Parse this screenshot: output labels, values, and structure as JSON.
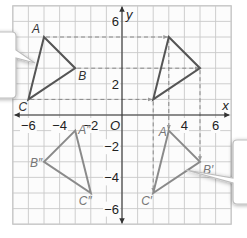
{
  "diagram": {
    "type": "coordinate-plane-transformation",
    "axes": {
      "x_label": "x",
      "y_label": "y",
      "origin_label": "O",
      "x_ticks": [
        {
          "value": -6,
          "label": "−6"
        },
        {
          "value": -4,
          "label": "−4"
        },
        {
          "value": -2,
          "label": "−2"
        },
        {
          "value": 4,
          "label": "4"
        },
        {
          "value": 6,
          "label": "6"
        }
      ],
      "y_ticks": [
        {
          "value": 6,
          "label": "6"
        },
        {
          "value": 2,
          "label": "2"
        },
        {
          "value": -2,
          "label": "−2"
        },
        {
          "value": -4,
          "label": "−4"
        },
        {
          "value": -6,
          "label": "−6"
        }
      ],
      "range": {
        "xmin": -7,
        "xmax": 7,
        "ymin": -7,
        "ymax": 7
      }
    },
    "triangles": [
      {
        "name": "original",
        "vertices": [
          {
            "label": "A",
            "x": -5,
            "y": 5
          },
          {
            "label": "B",
            "x": -3,
            "y": 3
          },
          {
            "label": "C",
            "x": -6,
            "y": 1
          }
        ]
      },
      {
        "name": "intermediate",
        "vertices": [
          {
            "label": "",
            "x": 3,
            "y": 5
          },
          {
            "label": "",
            "x": 5,
            "y": 3
          },
          {
            "label": "",
            "x": 2,
            "y": 1
          }
        ]
      },
      {
        "name": "image",
        "vertices": [
          {
            "label": "A′",
            "x": 3,
            "y": -1
          },
          {
            "label": "B′",
            "x": 5,
            "y": -3
          },
          {
            "label": "C′",
            "x": 2,
            "y": -5
          }
        ]
      },
      {
        "name": "reflection",
        "vertices": [
          {
            "label": "A″",
            "x": -3,
            "y": -1
          },
          {
            "label": "B″",
            "x": -5,
            "y": -3
          },
          {
            "label": "C″",
            "x": -2,
            "y": -5
          }
        ]
      }
    ],
    "colors": {
      "grid": "#c8c8c8",
      "axis": "#333333",
      "triangle_main": "#555555",
      "triangle_faded": "#8a8a8a",
      "dashed": "#888888",
      "label": "#666666",
      "callout_fill": "#ffffff",
      "callout_stroke": "#bdbdbd"
    }
  }
}
